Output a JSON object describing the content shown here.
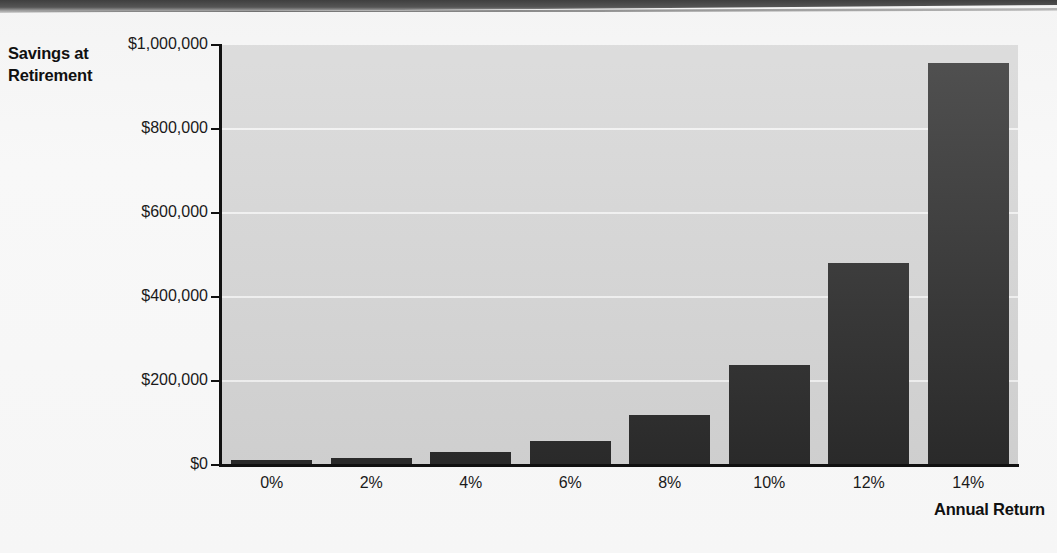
{
  "chart_data": {
    "type": "bar",
    "title": "",
    "xlabel": "Annual Return",
    "ylabel": "Savings at Retirement",
    "categories": [
      "0%",
      "2%",
      "4%",
      "6%",
      "8%",
      "10%",
      "12%",
      "14%"
    ],
    "values": [
      12000,
      17000,
      31000,
      58000,
      120000,
      238000,
      480000,
      958000
    ],
    "ylim": [
      0,
      1000000
    ],
    "ytick_labels": [
      "$1,000,000",
      "$800,000",
      "$600,000",
      "$400,000",
      "$200,000",
      "$0"
    ],
    "ytick_values": [
      1000000,
      800000,
      600000,
      400000,
      200000,
      0
    ],
    "grid": true,
    "legend": false,
    "bar_color": "#2b2b2b",
    "plot_background": "#d5d5d5",
    "gridline_color": "#f2f2f2",
    "axis_color": "#111111"
  },
  "axis_titles": {
    "y": "Savings at Retirement",
    "x": "Annual Return"
  }
}
